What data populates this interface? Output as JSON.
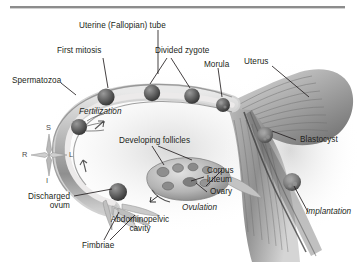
{
  "figure": {
    "background_color": "#ffffff",
    "text_color": "#231f20",
    "top_rule_color": "#8c8c8c"
  },
  "orientation_compass": {
    "name": "anatomical-orientation-rose",
    "superior": "S",
    "inferior": "I",
    "right": "R",
    "left": "L"
  },
  "labels": {
    "uterine_tube": "Uterine (Fallopian) tube",
    "first_mitosis": "First mitosis",
    "divided_zygote": "Divided zygote",
    "morula": "Morula",
    "uterus": "Uterus",
    "spermatozoa": "Spermatozoa",
    "fertilization": "Fertilization",
    "developing_follicles": "Developing follicles",
    "corpus_luteum_line1": "Corpus",
    "corpus_luteum_line2": "luteum",
    "ovary": "Ovary",
    "ovulation": "Ovulation",
    "abdominopelvic_line1": "Abdominopelvic",
    "abdominopelvic_line2": "cavity",
    "discharged_ovum_line1": "Discharged",
    "discharged_ovum_line2": "ovum",
    "fimbriae": "Fimbriae",
    "blastocyst": "Blastocyst",
    "implantation": "Implantation"
  },
  "structures": {
    "uterine_tube": "uterine-tube-illustration",
    "uterus_body": "uterus-illustration",
    "ovary": "ovary-illustration",
    "fimbriae": "fimbriae-illustration",
    "endometrium": "endometrium-illustration"
  },
  "cell_stages": [
    {
      "name": "discharged-ovum",
      "stage": "ovum"
    },
    {
      "name": "spermatozoa-cluster",
      "stage": "sperm"
    },
    {
      "name": "first-mitosis-cell",
      "stage": "zygote"
    },
    {
      "name": "divided-zygote-2cell",
      "stage": "2-cell"
    },
    {
      "name": "divided-zygote-4cell",
      "stage": "4-cell"
    },
    {
      "name": "morula-cell",
      "stage": "morula"
    },
    {
      "name": "blastocyst-cell",
      "stage": "blastocyst"
    },
    {
      "name": "implanting-blastocyst",
      "stage": "implantation"
    }
  ]
}
